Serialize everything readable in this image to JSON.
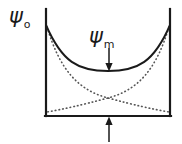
{
  "figure": {
    "background_color": "#ffffff",
    "line_color": "#1a1a1a",
    "dotted_color": "#555555",
    "width": 182,
    "height": 144,
    "labels": {
      "psi_zero": {
        "symbol": "ψ",
        "subscript": "o",
        "x": 9,
        "y": 6
      },
      "psi_m": {
        "symbol": "ψ",
        "subscript": "m",
        "x": 89,
        "y": 26
      }
    },
    "arrows": {
      "psi_m_arrow": {
        "name": "down-arrow",
        "direction": "down",
        "x": 109,
        "y_start": 48,
        "y_end": 70
      },
      "center_arrow": {
        "name": "up-arrow",
        "direction": "up",
        "x": 109,
        "y_start": 142,
        "y_end": 118
      }
    },
    "frame": {
      "left_wall_x": 46,
      "right_wall_x": 170,
      "top_y": 9,
      "baseline_y": 116
    },
    "curves": {
      "solid_sum": {
        "name": "solid-sum-curve",
        "style": "solid",
        "path": "M 46,25 C 62,62 78,71 108,71 C 138,71 154,62 170,25"
      },
      "dotted_left": {
        "name": "dotted-decay-left-curve",
        "style": "dotted",
        "path": "M 47,27 C 60,70 78,90 108,98 C 134,105 152,109 169,112"
      },
      "dotted_right": {
        "name": "dotted-decay-right-curve",
        "style": "dotted",
        "path": "M 169,27 C 156,70 138,90 108,98 C 82,105 64,109 47,112"
      }
    }
  }
}
